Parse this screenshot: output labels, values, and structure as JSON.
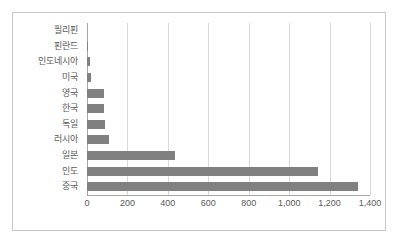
{
  "chart_data": {
    "type": "bar",
    "orientation": "horizontal",
    "title": "",
    "xlabel": "",
    "ylabel": "",
    "categories": [
      "필리핀",
      "핀란드",
      "인도네시아",
      "미국",
      "영국",
      "한국",
      "독일",
      "러시아",
      "일본",
      "인도",
      "중국"
    ],
    "values": [
      0,
      5,
      15,
      18,
      85,
      85,
      90,
      110,
      435,
      1145,
      1340
    ],
    "xlim": [
      0,
      1400
    ],
    "xticks": [
      0,
      200,
      400,
      600,
      800,
      1000,
      1200,
      1400
    ],
    "xtick_labels": [
      "0",
      "200",
      "400",
      "600",
      "800",
      "1,000",
      "1,200",
      "1,400"
    ],
    "grid": true,
    "legend": false,
    "series": [
      {
        "name": "",
        "values": [
          0,
          5,
          15,
          18,
          85,
          85,
          90,
          110,
          435,
          1145,
          1340
        ]
      }
    ]
  },
  "style": {
    "bar_color": "#808080",
    "grid_color": "#d9d9d9",
    "axis_color": "#a6a6a6",
    "border_color": "#c8c8c8",
    "text_color": "#595959",
    "background": "#ffffff"
  }
}
